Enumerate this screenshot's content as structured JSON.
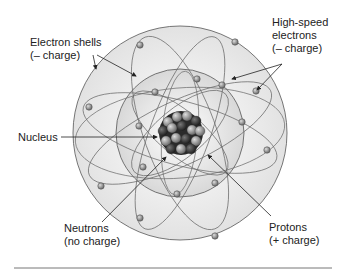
{
  "diagram": {
    "labels": {
      "electron_shells": [
        "Electron shells",
        "(– charge)"
      ],
      "high_speed_electrons": [
        "High-speed",
        "electrons",
        "(– charge)"
      ],
      "nucleus": "Nucleus",
      "neutrons": [
        "Neutrons",
        "(no charge)"
      ],
      "protons": [
        "Protons",
        "(+ charge)"
      ]
    },
    "colors": {
      "outer_shell": "#e6e6e6",
      "inner_shell": "#d4d4d4",
      "orbit_lines": "#6a6a6a",
      "electron": "#9a9a9a",
      "proton": "#7a7a7a",
      "neutron": "#3a3a3a",
      "text": "#222222"
    }
  }
}
